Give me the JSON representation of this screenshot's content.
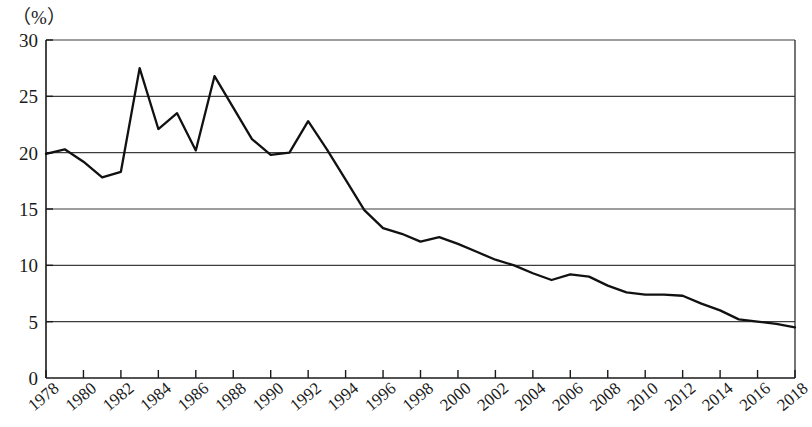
{
  "axis": {
    "unit_label": "（%）",
    "y_ticks": [
      "0",
      "5",
      "10",
      "15",
      "20",
      "25",
      "30"
    ],
    "x_ticks": [
      "1978",
      "1980",
      "1982",
      "1984",
      "1986",
      "1988",
      "1990",
      "1992",
      "1994",
      "1996",
      "1998",
      "2000",
      "2002",
      "2004",
      "2006",
      "2008",
      "2010",
      "2012",
      "2014",
      "2016",
      "2018"
    ]
  },
  "colors": {
    "line": "#111111",
    "grid": "#3d3d3d",
    "axis": "#1a1a1a",
    "background": "#ffffff"
  },
  "chart_data": {
    "type": "line",
    "title": "",
    "subtitle": "",
    "xlabel": "",
    "ylabel": "（%）",
    "xlim": [
      1978,
      2018
    ],
    "ylim": [
      0,
      30
    ],
    "grid": true,
    "legend": "none",
    "y_tick_values": [
      0,
      5,
      10,
      15,
      20,
      25,
      30
    ],
    "x_tick_values": [
      1978,
      1980,
      1982,
      1984,
      1986,
      1988,
      1990,
      1992,
      1994,
      1996,
      1998,
      2000,
      2002,
      2004,
      2006,
      2008,
      2010,
      2012,
      2014,
      2016,
      2018
    ],
    "x": [
      1978,
      1979,
      1980,
      1981,
      1982,
      1983,
      1984,
      1985,
      1986,
      1987,
      1988,
      1989,
      1990,
      1991,
      1992,
      1993,
      1994,
      1995,
      1996,
      1997,
      1998,
      1999,
      2000,
      2001,
      2002,
      2003,
      2004,
      2005,
      2006,
      2007,
      2008,
      2009,
      2010,
      2011,
      2012,
      2013,
      2014,
      2015,
      2016,
      2017,
      2018
    ],
    "values": [
      19.9,
      20.3,
      19.2,
      17.8,
      18.3,
      27.5,
      22.1,
      23.5,
      20.2,
      26.8,
      24.0,
      21.2,
      19.8,
      20.0,
      22.8,
      20.3,
      17.6,
      14.9,
      13.3,
      12.8,
      12.1,
      12.5,
      11.9,
      11.2,
      10.5,
      10.0,
      9.3,
      8.7,
      9.2,
      9.0,
      8.2,
      7.6,
      7.4,
      7.4,
      7.3,
      6.6,
      6.0,
      5.2,
      5.0,
      4.8,
      4.5
    ],
    "series": [
      {
        "name": "",
        "values": [
          19.9,
          20.3,
          19.2,
          17.8,
          18.3,
          27.5,
          22.1,
          23.5,
          20.2,
          26.8,
          24.0,
          21.2,
          19.8,
          20.0,
          22.8,
          20.3,
          17.6,
          14.9,
          13.3,
          12.8,
          12.1,
          12.5,
          11.9,
          11.2,
          10.5,
          10.0,
          9.3,
          8.7,
          9.2,
          9.0,
          8.2,
          7.6,
          7.4,
          7.4,
          7.3,
          6.6,
          6.0,
          5.2,
          5.0,
          4.8,
          4.5
        ]
      }
    ]
  },
  "plot_geometry": {
    "left": 46,
    "right": 795,
    "top": 40,
    "bottom": 378
  }
}
